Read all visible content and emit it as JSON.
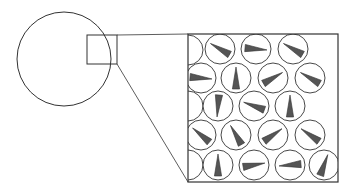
{
  "diagram": {
    "title": "",
    "colors": {
      "stroke": "#333333",
      "wedge_fill": "#555555",
      "stitch": "#777777",
      "background": "#ffffff"
    },
    "ball": {
      "cx": 64,
      "cy": 59,
      "r": 47
    },
    "source_box": {
      "x": 87,
      "y": 35,
      "w": 30,
      "h": 29
    },
    "inset_box": {
      "x": 188,
      "y": 34,
      "w": 150,
      "h": 148
    },
    "cell_radius": 15,
    "cells": [
      {
        "cx": 188,
        "cy": 50,
        "angle": 0,
        "wedge": false
      },
      {
        "cx": 220,
        "cy": 49,
        "angle": -60
      },
      {
        "cx": 256,
        "cy": 49,
        "angle": 95
      },
      {
        "cx": 293,
        "cy": 49,
        "angle": -60
      },
      {
        "cx": 201,
        "cy": 78,
        "angle": 95
      },
      {
        "cx": 236,
        "cy": 78,
        "angle": 0
      },
      {
        "cx": 273,
        "cy": 78,
        "angle": 60
      },
      {
        "cx": 310,
        "cy": 78,
        "angle": -60
      },
      {
        "cx": 188,
        "cy": 106,
        "angle": 0,
        "wedge": false
      },
      {
        "cx": 218,
        "cy": 106,
        "angle": 185
      },
      {
        "cx": 254,
        "cy": 106,
        "angle": -70
      },
      {
        "cx": 290,
        "cy": 106,
        "angle": 0
      },
      {
        "cx": 201,
        "cy": 135,
        "angle": -50
      },
      {
        "cx": 236,
        "cy": 135,
        "angle": -30
      },
      {
        "cx": 273,
        "cy": 135,
        "angle": 55
      },
      {
        "cx": 310,
        "cy": 135,
        "angle": -55
      },
      {
        "cx": 188,
        "cy": 165,
        "angle": 0,
        "wedge": false
      },
      {
        "cx": 218,
        "cy": 165,
        "angle": 0
      },
      {
        "cx": 254,
        "cy": 165,
        "angle": 80
      },
      {
        "cx": 290,
        "cy": 165,
        "angle": -95
      },
      {
        "cx": 324,
        "cy": 165,
        "angle": 20
      }
    ]
  }
}
